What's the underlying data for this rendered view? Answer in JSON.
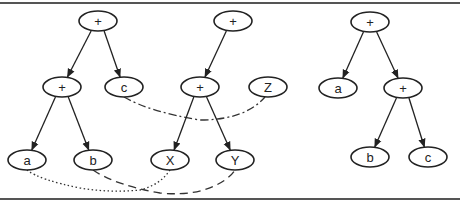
{
  "diagram": {
    "trees": [
      {
        "id": "left",
        "nodes": [
          {
            "id": "L0",
            "label": "+",
            "x": 98,
            "y": 21
          },
          {
            "id": "L1",
            "label": "+",
            "x": 62,
            "y": 87
          },
          {
            "id": "L2",
            "label": "c",
            "x": 124,
            "y": 87
          },
          {
            "id": "L3",
            "label": "a",
            "x": 27,
            "y": 160
          },
          {
            "id": "L4",
            "label": "b",
            "x": 93,
            "y": 160
          }
        ],
        "edges": [
          [
            "L0",
            "L1"
          ],
          [
            "L0",
            "L2"
          ],
          [
            "L1",
            "L3"
          ],
          [
            "L1",
            "L4"
          ]
        ]
      },
      {
        "id": "middle",
        "nodes": [
          {
            "id": "M0",
            "label": "+",
            "x": 233,
            "y": 21
          },
          {
            "id": "M1",
            "label": "+",
            "x": 200,
            "y": 87
          },
          {
            "id": "M2",
            "label": "Z",
            "x": 268,
            "y": 87
          },
          {
            "id": "M3",
            "label": "X",
            "x": 170,
            "y": 160
          },
          {
            "id": "M4",
            "label": "Y",
            "x": 235,
            "y": 160
          }
        ],
        "edges": [
          [
            "M0",
            "M1"
          ],
          [
            "M1",
            "M3"
          ],
          [
            "M1",
            "M4"
          ]
        ]
      },
      {
        "id": "right",
        "nodes": [
          {
            "id": "R0",
            "label": "+",
            "x": 370,
            "y": 22
          },
          {
            "id": "R1",
            "label": "a",
            "x": 338,
            "y": 88
          },
          {
            "id": "R2",
            "label": "+",
            "x": 403,
            "y": 88
          },
          {
            "id": "R3",
            "label": "b",
            "x": 370,
            "y": 157
          },
          {
            "id": "R4",
            "label": "c",
            "x": 428,
            "y": 157
          }
        ],
        "edges": [
          [
            "R0",
            "R1"
          ],
          [
            "R0",
            "R2"
          ],
          [
            "R2",
            "R3"
          ],
          [
            "R2",
            "R4"
          ]
        ]
      }
    ],
    "correspondences": [
      {
        "from": "L3",
        "to": "M3",
        "style": "dotted",
        "from_label": "a",
        "to_label": "X"
      },
      {
        "from": "L4",
        "to": "M4",
        "style": "dashed",
        "from_label": "b",
        "to_label": "Y"
      },
      {
        "from": "L2",
        "to": "M2",
        "style": "dash-dot",
        "from_label": "c",
        "to_label": "Z"
      }
    ]
  }
}
